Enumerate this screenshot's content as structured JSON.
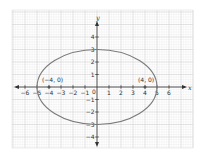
{
  "chart_data": {
    "type": "line",
    "title": "",
    "xlabel": "x",
    "ylabel": "y",
    "xlim": [
      -6.5,
      6.5
    ],
    "ylim": [
      -4.5,
      4.5
    ],
    "grid": true,
    "legend": null,
    "x_ticks": [
      -6,
      -5,
      -4,
      -3,
      -2,
      -1,
      1,
      2,
      3,
      4,
      5,
      6
    ],
    "x_tick_labels": [
      "−6",
      "−5",
      "−4",
      "−3",
      "−2",
      "−1",
      "1",
      "2",
      "3",
      "4",
      "5",
      "6"
    ],
    "y_ticks": [
      -4,
      -3,
      -2,
      -1,
      1,
      2,
      3,
      4
    ],
    "y_tick_labels": [
      "−4",
      "−3",
      "−2",
      "−1",
      "1",
      "2",
      "3",
      "4"
    ],
    "origin_label": "0",
    "series": [
      {
        "name": "ellipse",
        "shape": "ellipse",
        "center": [
          0,
          0
        ],
        "semi_major_x": 5,
        "semi_minor_y": 3,
        "color": "#7a7a7a"
      }
    ],
    "points": [
      {
        "x": -4,
        "y": 0,
        "label": "(−4, 0)"
      },
      {
        "x": 4,
        "y": 0,
        "label": "(4, 0)"
      }
    ]
  },
  "colors": {
    "background": "#ffffff",
    "minor_grid": "#ececec",
    "major_grid": "#d0d0d0",
    "axis": "#333333",
    "curve": "#7a7a7a",
    "point": "#555555"
  },
  "labels": {
    "x_axis_name": "x",
    "y_axis_name": "y",
    "focus_left": "(−4, 0)",
    "focus_right": "(4, 0)",
    "origin": "0"
  }
}
